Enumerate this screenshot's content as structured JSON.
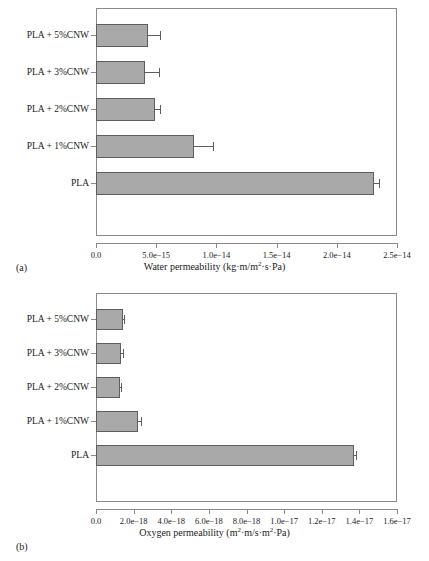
{
  "figure": {
    "panel_a_label": "(a)",
    "panel_b_label": "(b)",
    "bar_fill_color": "#a9a9a9",
    "bar_edge_color": "#5e5e5e",
    "axis_color": "#8a8a8a",
    "background_color": "#ffffff"
  },
  "chart_data": [
    {
      "type": "bar",
      "orientation": "horizontal",
      "panel": "(a)",
      "title": "",
      "xlabel": "Water permeability (kg·m/m²·s·Pa)",
      "ylabel": "",
      "categories": [
        "PLA",
        "PLA + 1%CNW",
        "PLA + 2%CNW",
        "PLA + 3%CNW",
        "PLA + 5%CNW"
      ],
      "values": [
        2.31e-14,
        8.1e-15,
        4.9e-15,
        4.05e-15,
        4.35e-15
      ],
      "errors": [
        4e-16,
        1.65e-15,
        4.5e-16,
        1.2e-15,
        1e-15
      ],
      "xlim": [
        0.0,
        2.5e-14
      ],
      "xticks": [
        0.0,
        5e-15,
        1e-14,
        1.5e-14,
        2e-14,
        2.5e-14
      ],
      "xticklabels": [
        "0.0",
        "5.0e−15",
        "1.0e−14",
        "1.5e−14",
        "2.0e−14",
        "2.5e−14"
      ],
      "grid": false,
      "legend": false
    },
    {
      "type": "bar",
      "orientation": "horizontal",
      "panel": "(b)",
      "title": "",
      "xlabel": "Oxygen permeability (m²·m/s·m²·Pa)",
      "ylabel": "",
      "categories": [
        "PLA",
        "PLA + 1%CNW",
        "PLA + 2%CNW",
        "PLA + 3%CNW",
        "PLA + 5%CNW"
      ],
      "values": [
        1.37e-17,
        2.25e-18,
        1.28e-18,
        1.33e-18,
        1.45e-18
      ],
      "errors": [
        1e-19,
        1.5e-19,
        6e-20,
        8e-20,
        6e-20
      ],
      "xlim": [
        0.0,
        1.6e-17
      ],
      "xticks": [
        0.0,
        2e-18,
        4e-18,
        6e-18,
        8e-18,
        1e-17,
        1.2e-17,
        1.4e-17,
        1.6e-17
      ],
      "xticklabels": [
        "0.0",
        "2.0e−18",
        "4.0e−18",
        "6.0e−18",
        "8.0e−18",
        "1.0e−17",
        "1.2e−17",
        "1.4e−17",
        "1.6e−17"
      ],
      "grid": false,
      "legend": false
    }
  ],
  "axis_labels": {
    "water_permeability": {
      "prefix": "Water permeability (kg·m/m",
      "sup": "2",
      "suffix": "·s·Pa)"
    },
    "oxygen_permeability": {
      "prefix": "Oxygen permeability (m",
      "sup1": "2",
      "mid": "·m/s·m",
      "sup2": "2",
      "suffix": "·Pa)"
    }
  }
}
